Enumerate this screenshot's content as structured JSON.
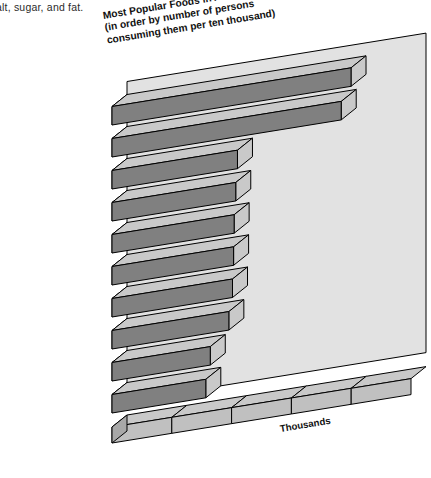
{
  "page_caption": "alt, sugar, and fat.",
  "chart_data": {
    "type": "bar",
    "orientation": "horizontal",
    "style": "3d-perspective",
    "title": "Most Popular Foods in America",
    "title_lines": [
      "Most Popular Foods in America",
      "(in order by number of persons",
      "consuming them per ten thousand)"
    ],
    "subtitle": "(in order by number of persons consuming them per ten thousand)",
    "xlabel": "Thousands",
    "ylabel": "",
    "xlim": [
      0,
      10
    ],
    "xticks": [
      0,
      2,
      4,
      6,
      8,
      10
    ],
    "xtick_labels": [
      "0",
      "2",
      "4",
      "6",
      "8",
      "10"
    ],
    "grid": false,
    "legend": false,
    "units": "persons per ten thousand",
    "categories": [
      "Coffee, tea",
      "White bread",
      "Margarine",
      "Whole-milk beverages",
      "Doughnuts, cookies",
      "Sugar",
      "Green salad",
      "Regular soft drinks",
      "Cheeses, not cottage",
      "Eggs"
    ],
    "values": [
      7994,
      7666,
      4196,
      4139,
      4085,
      4067,
      4030,
      3908,
      3287,
      3137
    ],
    "value_labels": [
      "7,994",
      "7,666",
      "4,196",
      "4,139",
      "4,085",
      "4,067",
      "4,03",
      "3,908",
      "3,287",
      "3,137"
    ]
  },
  "colors": {
    "bar_face": "#808080",
    "bar_top": "#c9c9c9",
    "bar_side": "#a8a8a8",
    "panel": "#e2e2e2",
    "axis_face": "#c0c0c0",
    "outline": "#000000",
    "background": "#ffffff"
  }
}
